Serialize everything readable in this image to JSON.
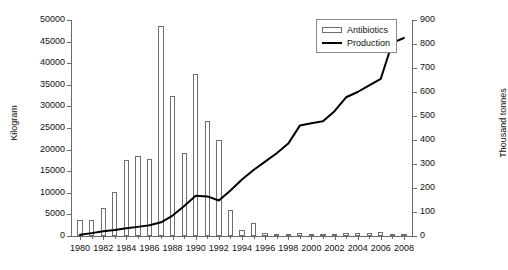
{
  "chart_data": {
    "type": "bar",
    "title": "",
    "subtitle": "",
    "xlabel": "",
    "ylabel": "Kilogram",
    "y2label": "Thousand tonnes",
    "grid": false,
    "legend_position": "top-right",
    "x": [
      1980,
      1981,
      1982,
      1983,
      1984,
      1985,
      1986,
      1987,
      1988,
      1989,
      1990,
      1991,
      1992,
      1993,
      1994,
      1995,
      1996,
      1997,
      1998,
      1999,
      2000,
      2001,
      2002,
      2003,
      2004,
      2005,
      2006,
      2007,
      2008
    ],
    "xticklabels": [
      "1980",
      "1982",
      "1984",
      "1986",
      "1988",
      "1990",
      "1992",
      "1994",
      "1996",
      "1998",
      "2000",
      "2002",
      "2004",
      "2006",
      "2008"
    ],
    "xlim": [
      1979.3,
      2008.7
    ],
    "ylim": [
      0,
      50000
    ],
    "yticks": [
      0,
      5000,
      10000,
      15000,
      20000,
      25000,
      30000,
      35000,
      40000,
      45000,
      50000
    ],
    "yticklabels": [
      "0",
      "5000",
      "10000",
      "15000",
      "20000",
      "25000",
      "30000",
      "35000",
      "40000",
      "45000",
      "50000"
    ],
    "y2lim": [
      0,
      900
    ],
    "y2ticks": [
      0,
      100,
      200,
      300,
      400,
      500,
      600,
      700,
      800,
      900
    ],
    "y2ticklabels": [
      "0",
      "100",
      "200",
      "300",
      "400",
      "500",
      "600",
      "700",
      "800",
      "900"
    ],
    "series": [
      {
        "name": "Antibiotics",
        "type": "bar",
        "axis": "left",
        "unit": "Kilogram",
        "color": "#ffffff",
        "edgecolor": "#6f6f6f",
        "values": [
          3700,
          3700,
          6600,
          10200,
          17700,
          18600,
          17900,
          48500,
          32400,
          19300,
          37400,
          26700,
          22300,
          6000,
          1300,
          3100,
          800,
          400,
          500,
          600,
          400,
          500,
          400,
          800,
          600,
          700,
          900,
          400,
          300
        ]
      },
      {
        "name": "Production",
        "type": "line",
        "axis": "right",
        "unit": "Thousand tonnes",
        "color": "#000000",
        "values": [
          5,
          12,
          20,
          25,
          32,
          38,
          45,
          57,
          85,
          125,
          168,
          165,
          148,
          190,
          235,
          275,
          310,
          345,
          385,
          460,
          470,
          478,
          520,
          578,
          600,
          628,
          655,
          805,
          825
        ]
      }
    ]
  },
  "legend": {
    "items": [
      {
        "label": "Antibiotics",
        "marker": "bar-swatch"
      },
      {
        "label": "Production",
        "marker": "line-swatch"
      }
    ]
  }
}
